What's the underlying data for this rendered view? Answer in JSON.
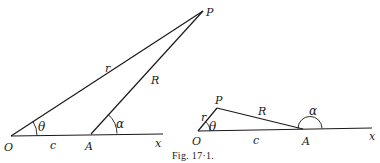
{
  "figure": {
    "caption": "Fig. 17·1.",
    "left_diagram": {
      "points": {
        "O": {
          "label": "O",
          "x": 11,
          "y": 136
        },
        "A": {
          "label": "A",
          "x": 91,
          "y": 134
        },
        "P": {
          "label": "P",
          "x": 203,
          "y": 11
        },
        "x_end": {
          "label": "x",
          "x": 163,
          "y": 134
        }
      },
      "segments": {
        "OP": {
          "label": "r"
        },
        "AP": {
          "label": "R"
        },
        "OA": {
          "label": "c"
        }
      },
      "angles": {
        "theta": {
          "label": "θ"
        },
        "alpha": {
          "label": "α"
        }
      }
    },
    "right_diagram": {
      "points": {
        "O": {
          "label": "O",
          "x": 198,
          "y": 131
        },
        "A": {
          "label": "A",
          "x": 303,
          "y": 129
        },
        "P": {
          "label": "P",
          "x": 217,
          "y": 108
        },
        "x_end": {
          "label": "x",
          "x": 370,
          "y": 129
        }
      },
      "segments": {
        "OP": {
          "label": "r"
        },
        "AP": {
          "label": "R"
        },
        "OA": {
          "label": "c"
        }
      },
      "angles": {
        "theta": {
          "label": "θ"
        },
        "alpha": {
          "label": "α"
        }
      }
    }
  }
}
